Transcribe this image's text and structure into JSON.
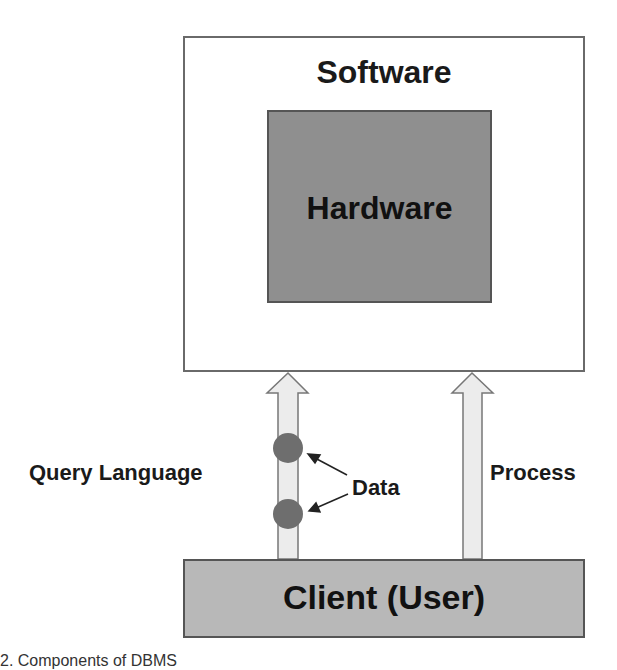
{
  "diagram": {
    "software": {
      "label": "Software",
      "fill": "#ffffff",
      "border": "#6a6a6a"
    },
    "hardware": {
      "label": "Hardware",
      "fill": "#8f8f8f",
      "border": "#555555"
    },
    "client": {
      "label": "Client (User)",
      "fill": "#b8b8b8",
      "border": "#555555"
    },
    "arrows": [
      {
        "id": "query-language-arrow",
        "label": "Query Language",
        "direction": "up",
        "fill": "#ececec"
      },
      {
        "id": "process-arrow",
        "label": "Process",
        "direction": "up",
        "fill": "#ececec"
      }
    ],
    "data_markers": {
      "label": "Data",
      "count": 2,
      "color": "#6e6e6e"
    },
    "caption_fragment": "2.  Components of DBMS"
  }
}
